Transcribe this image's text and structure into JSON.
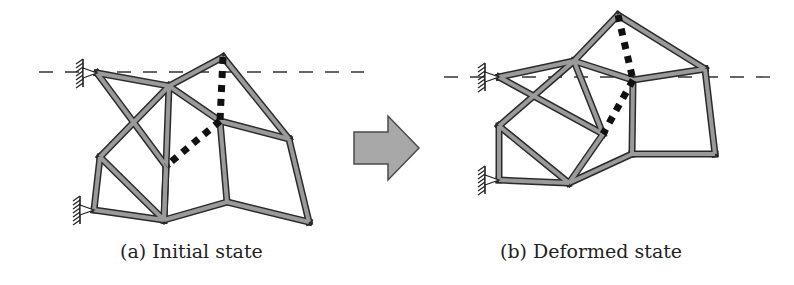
{
  "captions": {
    "a": "(a) Initial state",
    "b": "(b) Deformed state"
  },
  "colors": {
    "bar_fill": "#9a9a9a",
    "bar_outline": "#2a2a2a",
    "dashed_reference": "#333333",
    "arrow_fill": "#a8a8a8",
    "arrow_outline": "#4a4a4a",
    "cable": "#111111"
  },
  "diagrams": [
    {
      "id": "initial",
      "nodes": {
        "A": [
          97,
          73
        ],
        "B": [
          169,
          86
        ],
        "C": [
          223,
          57
        ],
        "D": [
          220,
          121
        ],
        "E": [
          289,
          139
        ],
        "F": [
          100,
          157
        ],
        "G": [
          166,
          166
        ],
        "H": [
          94,
          210
        ],
        "I": [
          164,
          220
        ],
        "J": [
          227,
          202
        ],
        "K": [
          309,
          222
        ]
      },
      "bars": [
        [
          "A",
          "B"
        ],
        [
          "A",
          "G"
        ],
        [
          "B",
          "C"
        ],
        [
          "B",
          "D"
        ],
        [
          "B",
          "F"
        ],
        [
          "B",
          "I"
        ],
        [
          "C",
          "E"
        ],
        [
          "D",
          "E"
        ],
        [
          "D",
          "J"
        ],
        [
          "E",
          "K"
        ],
        [
          "F",
          "H"
        ],
        [
          "F",
          "I"
        ],
        [
          "H",
          "I"
        ],
        [
          "I",
          "J"
        ],
        [
          "J",
          "K"
        ],
        [
          "G",
          "I"
        ]
      ],
      "cable": [
        [
          "C",
          "D"
        ],
        [
          "D",
          "G"
        ]
      ],
      "supports": [
        [
          97,
          73
        ],
        [
          94,
          210
        ]
      ],
      "reference_line_y": 72
    },
    {
      "id": "deformed",
      "nodes": {
        "A": [
          499,
          77
        ],
        "B": [
          574,
          61
        ],
        "C": [
          618,
          15
        ],
        "D": [
          633,
          80
        ],
        "E": [
          705,
          69
        ],
        "F": [
          499,
          126
        ],
        "G": [
          603,
          134
        ],
        "H": [
          499,
          180
        ],
        "I": [
          569,
          183
        ],
        "J": [
          632,
          154
        ],
        "K": [
          715,
          154
        ]
      },
      "bars": [
        [
          "A",
          "B"
        ],
        [
          "A",
          "G"
        ],
        [
          "B",
          "C"
        ],
        [
          "B",
          "D"
        ],
        [
          "B",
          "F"
        ],
        [
          "B",
          "G"
        ],
        [
          "C",
          "E"
        ],
        [
          "D",
          "E"
        ],
        [
          "D",
          "J"
        ],
        [
          "E",
          "K"
        ],
        [
          "F",
          "H"
        ],
        [
          "F",
          "I"
        ],
        [
          "H",
          "I"
        ],
        [
          "I",
          "J"
        ],
        [
          "J",
          "K"
        ],
        [
          "G",
          "I"
        ]
      ],
      "cable": [
        [
          "C",
          "D"
        ],
        [
          "D",
          "G"
        ]
      ],
      "supports": [
        [
          499,
          77
        ],
        [
          499,
          180
        ]
      ],
      "reference_line_y": 77
    }
  ],
  "arrow": {
    "direction": "right",
    "label": ""
  }
}
